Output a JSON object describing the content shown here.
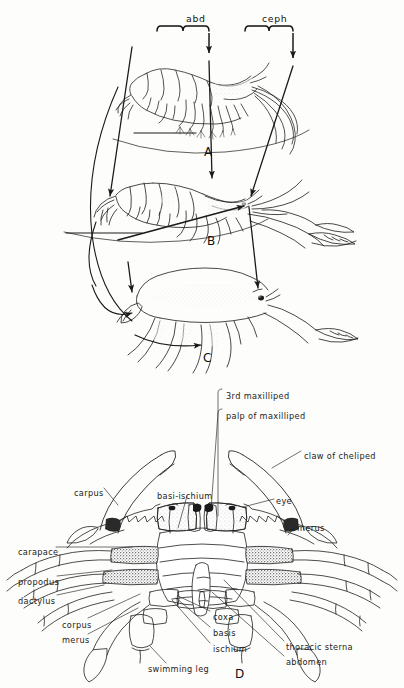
{
  "plate": {
    "title": "Crustacean body form series and crab ventral anatomy",
    "background_color": "#fdfdfb",
    "ink_color": "#1a1a1a",
    "shade_color": "#6e6e6e"
  },
  "top_brackets": [
    {
      "id": "abd",
      "label": "abd",
      "x": 186,
      "y": 14
    },
    {
      "id": "ceph",
      "label": "ceph",
      "x": 262,
      "y": 14
    }
  ],
  "panels": [
    {
      "id": "A",
      "letter": "A",
      "x": 204,
      "y": 146,
      "subject": "prawn-shrimp-lateral"
    },
    {
      "id": "B",
      "letter": "B",
      "x": 207,
      "y": 235,
      "subject": "lobster-crayfish-lateral"
    },
    {
      "id": "C",
      "letter": "C",
      "x": 203,
      "y": 352,
      "subject": "crab-like-lateral"
    },
    {
      "id": "D",
      "letter": "D",
      "x": 235,
      "y": 668,
      "subject": "crab-ventral-anatomy"
    }
  ],
  "crab_labels": [
    {
      "id": "third-maxilliped",
      "text": "3rd maxilliped",
      "x": 226,
      "y": 392,
      "align": "left"
    },
    {
      "id": "palp-of-maxilliped",
      "text": "palp of maxilliped",
      "x": 226,
      "y": 412,
      "align": "left"
    },
    {
      "id": "claw-of-cheliped",
      "text": "claw of cheliped",
      "x": 304,
      "y": 452,
      "align": "left"
    },
    {
      "id": "carpus",
      "text": "carpus",
      "x": 74,
      "y": 489,
      "align": "left"
    },
    {
      "id": "basi-ischium",
      "text": "basi-ischium",
      "x": 157,
      "y": 492,
      "align": "left"
    },
    {
      "id": "eye",
      "text": "eye",
      "x": 276,
      "y": 497,
      "align": "left"
    },
    {
      "id": "merus-right",
      "text": "merus",
      "x": 297,
      "y": 524,
      "align": "left"
    },
    {
      "id": "carapace",
      "text": "carapace",
      "x": 18,
      "y": 548,
      "align": "left"
    },
    {
      "id": "propodus",
      "text": "propodus",
      "x": 18,
      "y": 578,
      "align": "left"
    },
    {
      "id": "dactylus",
      "text": "dactylus",
      "x": 18,
      "y": 597,
      "align": "left"
    },
    {
      "id": "corpus",
      "text": "corpus",
      "x": 62,
      "y": 621,
      "align": "left"
    },
    {
      "id": "merus-left",
      "text": "merus",
      "x": 62,
      "y": 636,
      "align": "left"
    },
    {
      "id": "coxa",
      "text": "coxa",
      "x": 213,
      "y": 613,
      "align": "left"
    },
    {
      "id": "basis",
      "text": "basis",
      "x": 213,
      "y": 629,
      "align": "left"
    },
    {
      "id": "ischium",
      "text": "ischium",
      "x": 213,
      "y": 645,
      "align": "left"
    },
    {
      "id": "thoracic-sterna",
      "text": "thoracic sterna",
      "x": 286,
      "y": 643,
      "align": "left"
    },
    {
      "id": "abdomen",
      "text": "abdomen",
      "x": 286,
      "y": 658,
      "align": "left"
    },
    {
      "id": "swimming-leg",
      "text": "swimming leg",
      "x": 148,
      "y": 665,
      "align": "left"
    }
  ]
}
